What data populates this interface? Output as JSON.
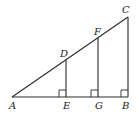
{
  "diagram": {
    "type": "geometry",
    "points": {
      "A": {
        "label": "A",
        "x": 12,
        "y": 97
      },
      "E": {
        "label": "E",
        "x": 66,
        "y": 97
      },
      "G": {
        "label": "G",
        "x": 98,
        "y": 97
      },
      "B": {
        "label": "B",
        "x": 128,
        "y": 97
      },
      "D": {
        "label": "D",
        "x": 66,
        "y": 60
      },
      "F": {
        "label": "F",
        "x": 98,
        "y": 38
      },
      "C": {
        "label": "C",
        "x": 128,
        "y": 17
      }
    },
    "segments": [
      [
        "A",
        "B"
      ],
      [
        "A",
        "C"
      ],
      [
        "B",
        "C"
      ],
      [
        "D",
        "E"
      ],
      [
        "F",
        "G"
      ]
    ],
    "right_angles": [
      "E",
      "G",
      "B"
    ],
    "labels": {
      "A": "A",
      "B": "B",
      "C": "C",
      "D": "D",
      "E": "E",
      "F": "F",
      "G": "G"
    }
  }
}
